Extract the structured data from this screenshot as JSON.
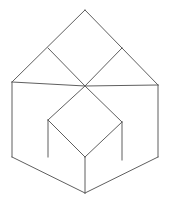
{
  "figure": {
    "name": "isometric-cube-illusion",
    "background_color": "#ffffff",
    "line_color": "#5f5f5f",
    "line_width": 1,
    "canvas": {
      "width": 170,
      "height": 208
    },
    "vertices": {
      "top_apex": [
        85,
        10
      ],
      "upper_left_joint": [
        48,
        48
      ],
      "upper_right_joint": [
        122,
        48
      ],
      "left_outer_top": [
        12,
        82
      ],
      "right_outer_top": [
        158,
        85
      ],
      "center": [
        85,
        86
      ],
      "left_mid": [
        48,
        120
      ],
      "right_mid": [
        122,
        122
      ],
      "left_outer_bottom": [
        12,
        157
      ],
      "right_outer_bottom": [
        158,
        157
      ],
      "bottom_center_joint": [
        85,
        157
      ],
      "left_lower_joint": [
        48,
        157
      ],
      "right_lower_joint": [
        122,
        160
      ],
      "bottom_apex": [
        85,
        193
      ]
    },
    "edges": [
      {
        "name": "top-left-upper-edge",
        "from": "left_outer_top",
        "to": "top_apex"
      },
      {
        "name": "top-right-upper-edge",
        "from": "top_apex",
        "to": "right_outer_top"
      },
      {
        "name": "upper-left-diagonal",
        "from": "upper_left_joint",
        "to": "center"
      },
      {
        "name": "upper-right-diagonal",
        "from": "center",
        "to": "upper_right_joint"
      },
      {
        "name": "center-to-left-outer",
        "from": "center",
        "to": "left_outer_top"
      },
      {
        "name": "center-to-right-outer",
        "from": "center",
        "to": "right_outer_top"
      },
      {
        "name": "left-outer-vertical",
        "from": "left_outer_top",
        "to": "left_outer_bottom"
      },
      {
        "name": "right-outer-vertical",
        "from": "right_outer_top",
        "to": "right_outer_bottom"
      },
      {
        "name": "left-inner-vertical",
        "from": "left_mid",
        "to": "left_lower_joint"
      },
      {
        "name": "right-inner-vertical",
        "from": "right_mid",
        "to": "right_lower_joint"
      },
      {
        "name": "center-bottom-vertical",
        "from": "bottom_center_joint",
        "to": "bottom_apex"
      },
      {
        "name": "lower-left-diagonal",
        "from": "center",
        "to": "left_mid"
      },
      {
        "name": "lower-right-diagonal",
        "from": "center",
        "to": "right_mid"
      },
      {
        "name": "bottom-left-outer-diagonal",
        "from": "left_outer_bottom",
        "to": "bottom_apex"
      },
      {
        "name": "bottom-right-outer-diagonal",
        "from": "bottom_apex",
        "to": "right_outer_bottom"
      },
      {
        "name": "left-mid-to-bottom-center",
        "from": "left_mid",
        "to": "bottom_center_joint"
      },
      {
        "name": "right-mid-to-bottom-center",
        "from": "right_mid",
        "to": "bottom_center_joint"
      }
    ],
    "faces": [
      {
        "name": "top-left-rhombus",
        "points": "12,82 48,48 85,86 48,120"
      },
      {
        "name": "top-center-rhombus",
        "points": "48,48 85,10 122,48 85,86"
      },
      {
        "name": "top-right-rhombus",
        "points": "85,86 122,48 158,85 122,122"
      },
      {
        "name": "lower-left-parallelogram",
        "points": "12,82 48,120 48,157 12,157"
      },
      {
        "name": "lower-center-left-parallelogram",
        "points": "48,120 85,86 85,157 48,157"
      },
      {
        "name": "lower-center-right-parallelogram",
        "points": "85,86 122,122 122,160 85,157"
      },
      {
        "name": "lower-right-parallelogram",
        "points": "122,122 158,85 158,157 122,160"
      },
      {
        "name": "bottom-left-triangle",
        "points": "12,157 48,157 85,193 85,157"
      },
      {
        "name": "bottom-right-triangle",
        "points": "85,157 122,160 158,157 85,193"
      }
    ]
  }
}
